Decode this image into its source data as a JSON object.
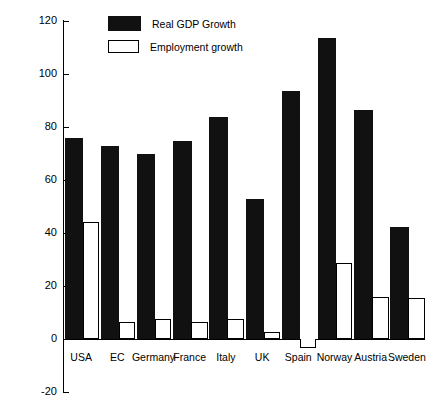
{
  "chart_data": {
    "type": "bar",
    "title": "",
    "xlabel": "",
    "ylabel": "",
    "ylim": [
      -20,
      120
    ],
    "ytick_labels": [
      "120",
      "100",
      "80",
      "60",
      "40",
      "20",
      "0",
      "-20"
    ],
    "yticks": [
      120,
      100,
      80,
      60,
      40,
      20,
      0,
      -20
    ],
    "grid": false,
    "legend_position": "top-left-inside",
    "categories": [
      "USA",
      "EC",
      "Germany",
      "France",
      "Italy",
      "UK",
      "Spain",
      "Norway",
      "Austria",
      "Sweden"
    ],
    "series": [
      {
        "name": "Real GDP Growth",
        "color": "#111111",
        "style": "filled",
        "values": [
          75,
          72,
          69,
          74,
          83,
          52,
          93,
          113,
          85.5,
          41.5
        ]
      },
      {
        "name": "Employment growth",
        "color": "#ffffff",
        "style": "hollow",
        "values": [
          44,
          6.5,
          7.5,
          6.5,
          7.5,
          2.5,
          -3.5,
          28.5,
          16,
          15.5
        ]
      }
    ]
  },
  "axis": {
    "zero_label": "0",
    "min_label": "-20",
    "max_label": "120"
  }
}
